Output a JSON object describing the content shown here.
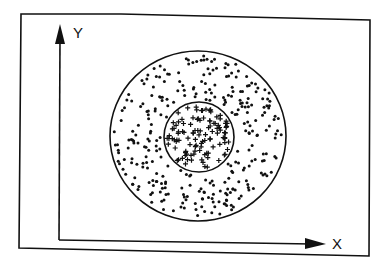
{
  "diagram": {
    "type": "scatter-diagram",
    "axes": {
      "x_label": "X",
      "y_label": "Y"
    },
    "regions": [
      {
        "name": "outer-region",
        "shape": "circle",
        "marker": "dot",
        "center": [
          198,
          136
        ],
        "rx": 88,
        "ry": 85,
        "count": 300
      },
      {
        "name": "inner-region",
        "shape": "circle",
        "marker": "plus",
        "center": [
          199,
          137
        ],
        "r": 35,
        "count": 110
      }
    ],
    "colors": {
      "ink": "#111111",
      "background": "#ffffff"
    }
  }
}
